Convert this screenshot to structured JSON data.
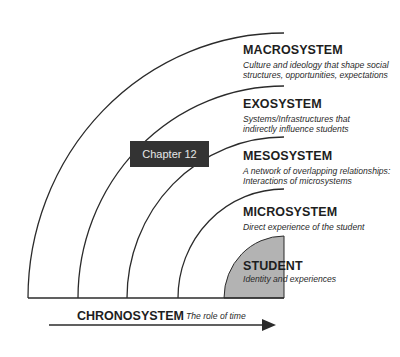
{
  "diagram": {
    "colors": {
      "line": "#2b2b2b",
      "student_fill": "#b3b3b3",
      "chapter_box_bg": "#333333",
      "chapter_box_text": "#e6e6e6"
    },
    "layers": [
      {
        "id": "macrosystem",
        "title": "MACROSYSTEM",
        "desc_lines": [
          "Culture and ideology that shape social",
          "structures, opportunities, expectations"
        ]
      },
      {
        "id": "exosystem",
        "title": "EXOSYSTEM",
        "desc_lines": [
          "Systems/Infrastructures that",
          "indirectly influence students"
        ]
      },
      {
        "id": "mesosystem",
        "title": "MESOSYSTEM",
        "desc_lines": [
          "A network of overlapping relationships:",
          "Interactions of microsystems"
        ]
      },
      {
        "id": "microsystem",
        "title": "MICROSYSTEM",
        "desc_lines": [
          "Direct experience of the student"
        ]
      },
      {
        "id": "student",
        "title": "STUDENT",
        "desc_lines": [
          "Identity and experiences"
        ]
      }
    ],
    "chapter_tag": "Chapter 12",
    "chronosystem": {
      "title": "CHRONOSYSTEM",
      "desc": "The role of time"
    }
  }
}
